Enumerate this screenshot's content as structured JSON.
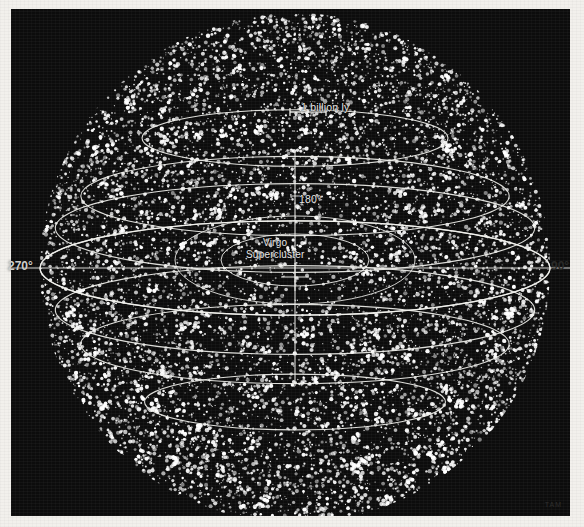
{
  "figure": {
    "background_color": "#f2f0ec",
    "plate_color": "#0c0c0c",
    "grid_color": "#f0f0ec",
    "dot_color": "#ffffff"
  },
  "annotations": {
    "scale_label": "1 billion ly",
    "meridian_label": "180°",
    "virgo_line1": "Virgo",
    "virgo_line2": "Supercluster",
    "left_label": "270°",
    "right_label": "90°",
    "watermark": "TAM"
  },
  "chart_data": {
    "type": "scatter",
    "title": "1 billion ly",
    "projection": "orthographic-sphere",
    "xlabel": "",
    "ylabel": "",
    "grid": true,
    "legend": "none",
    "sphere": {
      "center_x": 284,
      "center_y": 259,
      "radius": 255,
      "point_count": 9000,
      "point_color": "#ffffff",
      "point_radius_px": [
        0.6,
        2.2
      ]
    },
    "scale_bar": {
      "label": "1 billion ly",
      "x_start": 290,
      "x_end": 326,
      "y": 112,
      "length_px": 36
    },
    "longitude_ticks": [
      {
        "label": "270°",
        "position": "left"
      },
      {
        "label": "180°",
        "position": "center-top"
      },
      {
        "label": "90°",
        "position": "right"
      }
    ],
    "latitude_rings": [
      {
        "y_offset": -130,
        "rx_frac": 0.6
      },
      {
        "y_offset": -72,
        "rx_frac": 0.84
      },
      {
        "y_offset": -40,
        "rx_frac": 0.94
      },
      {
        "y_offset": 0,
        "rx_frac": 1.0
      },
      {
        "y_offset": 42,
        "rx_frac": 0.94
      },
      {
        "y_offset": 76,
        "rx_frac": 0.84
      },
      {
        "y_offset": 134,
        "rx_frac": 0.59
      }
    ],
    "annotations": [
      {
        "text": "Virgo Supercluster",
        "x": 252,
        "y": 232
      },
      {
        "text": "180°",
        "x": 288,
        "y": 186
      }
    ]
  }
}
